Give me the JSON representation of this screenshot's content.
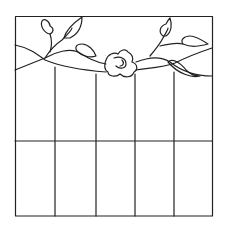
{
  "image": {
    "subject": "stained-glass-pattern",
    "colors": {
      "line": "#222222",
      "background": "#ffffff"
    },
    "frame": {
      "x": 15,
      "y": 16,
      "width": 197,
      "height": 200
    },
    "vertical_lines_x": [
      55,
      96,
      135,
      174
    ],
    "horizontal_line_y": 141,
    "motifs": [
      "vine",
      "leaves",
      "rose"
    ]
  }
}
